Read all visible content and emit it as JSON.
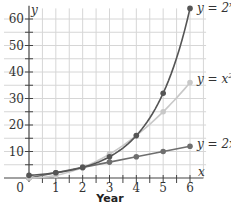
{
  "chart_data": {
    "type": "line",
    "title": "",
    "xlabel": "Year",
    "ylabel": "",
    "x_axis_letter": "x",
    "y_axis_letter": "y",
    "x": [
      0,
      1,
      2,
      3,
      4,
      5,
      6
    ],
    "xlim": [
      0,
      6
    ],
    "ylim": [
      0,
      64
    ],
    "x_ticks": [
      "0",
      "1",
      "2",
      "3",
      "4",
      "5",
      "6"
    ],
    "y_ticks": [
      "10",
      "20",
      "30",
      "40",
      "50",
      "60"
    ],
    "grid": true,
    "series": [
      {
        "name": "y = 2^x",
        "label_base": "y = 2",
        "label_sup": "x",
        "color": "#555555",
        "values": [
          1,
          2,
          4,
          8,
          16,
          32,
          64
        ]
      },
      {
        "name": "y = x^2",
        "label_base": "y = x",
        "label_sup": "2",
        "color": "#c8c8c8",
        "values": [
          0,
          1,
          4,
          9,
          16,
          25,
          36
        ]
      },
      {
        "name": "y = 2x",
        "label_base": "y = 2x",
        "label_sup": "",
        "color": "#6e6e6e",
        "values": [
          0,
          2,
          4,
          6,
          8,
          10,
          12
        ]
      }
    ],
    "legend": "inline labels at right end of each curve"
  }
}
